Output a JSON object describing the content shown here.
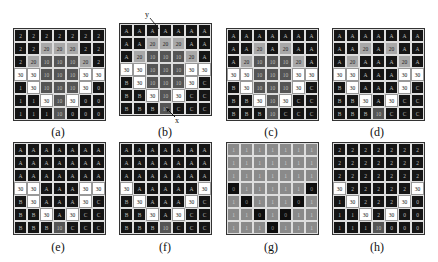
{
  "panels": [
    {
      "id": "a",
      "caption": "(a)",
      "grid": [
        [
          "2",
          "2",
          "2",
          "2",
          "2",
          "2",
          "2"
        ],
        [
          "2",
          "2",
          "20",
          "20",
          "20",
          "2",
          "2"
        ],
        [
          "2",
          "20",
          "10",
          "10",
          "10",
          "20",
          "2"
        ],
        [
          "30",
          "30",
          "10",
          "10",
          "10",
          "30",
          "30"
        ],
        [
          "1",
          "30",
          "10",
          "10",
          "10",
          "30",
          "0"
        ],
        [
          "1",
          "1",
          "30",
          "10",
          "30",
          "0",
          "0"
        ],
        [
          "1",
          "1",
          "1",
          "10",
          "0",
          "0",
          "0"
        ]
      ]
    },
    {
      "id": "b",
      "caption": "(b)",
      "axis_y": "y",
      "axis_x": "x",
      "grid": [
        [
          "A",
          "A",
          "A",
          "A",
          "A",
          "A",
          "A"
        ],
        [
          "A",
          "A",
          "20",
          "20",
          "20",
          "A",
          "A"
        ],
        [
          "A",
          "20",
          "10",
          "10",
          "10",
          "20",
          "A"
        ],
        [
          "30",
          "30",
          "10",
          "10",
          "10",
          "30",
          "30"
        ],
        [
          "B",
          "30",
          "10",
          "10",
          "10",
          "30",
          "C"
        ],
        [
          "B",
          "B",
          "30",
          "10",
          "30",
          "C",
          "C"
        ],
        [
          "B",
          "B",
          "B",
          "10",
          "C",
          "C",
          "C"
        ]
      ]
    },
    {
      "id": "c",
      "caption": "(c)",
      "grid": [
        [
          "A",
          "A",
          "A",
          "A",
          "A",
          "A",
          "A"
        ],
        [
          "A",
          "A",
          "20",
          "A",
          "20",
          "A",
          "A"
        ],
        [
          "A",
          "20",
          "10",
          "10",
          "10",
          "20",
          "A"
        ],
        [
          "30",
          "30",
          "10",
          "10",
          "10",
          "30",
          "30"
        ],
        [
          "B",
          "30",
          "10",
          "10",
          "10",
          "30",
          "C"
        ],
        [
          "B",
          "B",
          "30",
          "10",
          "30",
          "C",
          "C"
        ],
        [
          "B",
          "B",
          "B",
          "10",
          "C",
          "C",
          "C"
        ]
      ]
    },
    {
      "id": "d",
      "caption": "(d)",
      "grid": [
        [
          "A",
          "A",
          "A",
          "A",
          "A",
          "A",
          "A"
        ],
        [
          "A",
          "A",
          "20",
          "A",
          "20",
          "A",
          "A"
        ],
        [
          "A",
          "20",
          "A",
          "A",
          "A",
          "20",
          "A"
        ],
        [
          "30",
          "30",
          "A",
          "A",
          "A",
          "30",
          "30"
        ],
        [
          "B",
          "30",
          "A",
          "A",
          "A",
          "30",
          "C"
        ],
        [
          "B",
          "B",
          "30",
          "A",
          "30",
          "C",
          "C"
        ],
        [
          "B",
          "B",
          "B",
          "10",
          "C",
          "C",
          "C"
        ]
      ]
    },
    {
      "id": "e",
      "caption": "(e)",
      "grid": [
        [
          "A",
          "A",
          "A",
          "A",
          "A",
          "A",
          "A"
        ],
        [
          "A",
          "A",
          "A",
          "A",
          "A",
          "A",
          "A"
        ],
        [
          "A",
          "A",
          "A",
          "A",
          "A",
          "A",
          "A"
        ],
        [
          "30",
          "30",
          "A",
          "A",
          "A",
          "30",
          "30"
        ],
        [
          "B",
          "30",
          "A",
          "A",
          "A",
          "30",
          "C"
        ],
        [
          "B",
          "B",
          "30",
          "A",
          "30",
          "C",
          "C"
        ],
        [
          "B",
          "B",
          "B",
          "10",
          "C",
          "C",
          "C"
        ]
      ]
    },
    {
      "id": "f",
      "caption": "(f)",
      "grid": [
        [
          "A",
          "A",
          "A",
          "A",
          "A",
          "A",
          "A"
        ],
        [
          "A",
          "A",
          "A",
          "A",
          "A",
          "A",
          "A"
        ],
        [
          "A",
          "A",
          "A",
          "A",
          "A",
          "A",
          "A"
        ],
        [
          "30",
          "A",
          "A",
          "A",
          "A",
          "A",
          "30"
        ],
        [
          "B",
          "30",
          "A",
          "A",
          "A",
          "30",
          "C"
        ],
        [
          "B",
          "B",
          "30",
          "A",
          "30",
          "C",
          "C"
        ],
        [
          "B",
          "B",
          "B",
          "10",
          "C",
          "C",
          "C"
        ]
      ]
    },
    {
      "id": "g",
      "caption": "(g)",
      "binary": true,
      "grid": [
        [
          "1",
          "1",
          "1",
          "1",
          "1",
          "1",
          "1"
        ],
        [
          "1",
          "1",
          "1",
          "1",
          "1",
          "1",
          "1"
        ],
        [
          "1",
          "1",
          "1",
          "1",
          "1",
          "1",
          "1"
        ],
        [
          "0",
          "1",
          "1",
          "1",
          "1",
          "1",
          "0"
        ],
        [
          "1",
          "0",
          "1",
          "1",
          "1",
          "0",
          "1"
        ],
        [
          "1",
          "1",
          "0",
          "1",
          "0",
          "1",
          "1"
        ],
        [
          "1",
          "1",
          "1",
          "0",
          "1",
          "1",
          "1"
        ]
      ]
    },
    {
      "id": "h",
      "caption": "(h)",
      "grid": [
        [
          "2",
          "2",
          "2",
          "2",
          "2",
          "2",
          "2"
        ],
        [
          "2",
          "2",
          "2",
          "2",
          "2",
          "2",
          "2"
        ],
        [
          "2",
          "2",
          "2",
          "2",
          "2",
          "2",
          "2"
        ],
        [
          "30",
          "2",
          "2",
          "2",
          "2",
          "2",
          "30"
        ],
        [
          "1",
          "30",
          "2",
          "2",
          "2",
          "30",
          "0"
        ],
        [
          "1",
          "1",
          "30",
          "2",
          "30",
          "0",
          "0"
        ],
        [
          "1",
          "1",
          "1",
          "10",
          "0",
          "0",
          "0"
        ]
      ]
    }
  ],
  "colors": {
    "dark": "#151515",
    "level20": "#a8a8a8",
    "level10": "#555555",
    "level30": "#ffffff",
    "binary1": "#8a8a8a",
    "binary0": "#0e0e0e"
  }
}
